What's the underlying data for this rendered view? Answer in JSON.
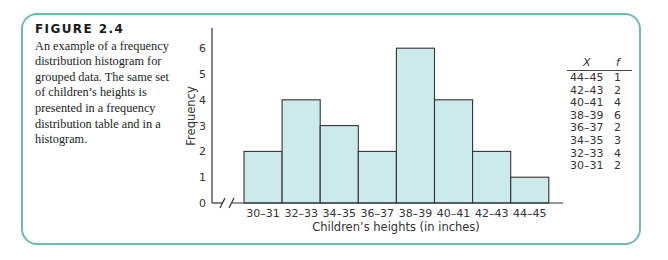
{
  "caption": {
    "title": "FIGURE 2.4",
    "text": "An example of a frequency distribution histogram for grouped data. The same set of children’s heights is presented in a frequency distribution table and in a histogram."
  },
  "colors": {
    "frame": "#6fbab0",
    "bar_fill": "#cdeaea",
    "bar_stroke": "#333333"
  },
  "chart_data": {
    "type": "bar",
    "title": "",
    "xlabel": "Children’s heights (in inches)",
    "ylabel": "Frequency",
    "categories": [
      "30–31",
      "32–33",
      "34–35",
      "36–37",
      "38–39",
      "40–41",
      "42–43",
      "44–45"
    ],
    "values": [
      2,
      4,
      3,
      2,
      6,
      4,
      2,
      1
    ],
    "yticks": [
      0,
      1,
      2,
      3,
      4,
      5,
      6
    ],
    "ylim": [
      0,
      6.6
    ],
    "grid": false,
    "axis_break": true
  },
  "table": {
    "headers": {
      "x": "X",
      "f": "f"
    },
    "rows": [
      {
        "x": "44–45",
        "f": "1"
      },
      {
        "x": "42–43",
        "f": "2"
      },
      {
        "x": "40–41",
        "f": "4"
      },
      {
        "x": "38–39",
        "f": "6"
      },
      {
        "x": "36–37",
        "f": "2"
      },
      {
        "x": "34–35",
        "f": "3"
      },
      {
        "x": "32–33",
        "f": "4"
      },
      {
        "x": "30–31",
        "f": "2"
      }
    ]
  }
}
